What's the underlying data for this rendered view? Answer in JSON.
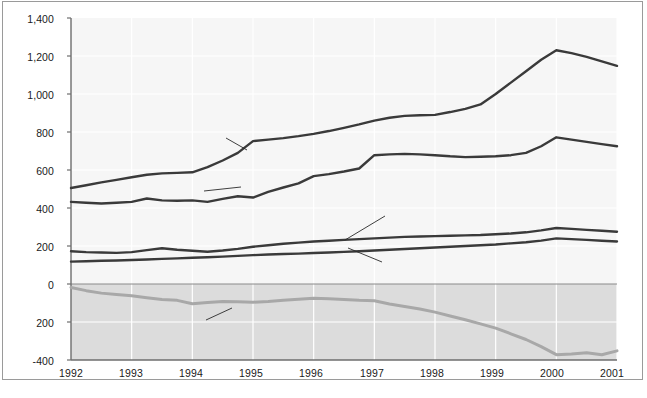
{
  "figure": {
    "background_color": "#ffffff",
    "frame_color": "#9a9a9a",
    "plot_background_color": "#f6f6f6",
    "negative_band_color": "#dcdcdc",
    "gridline_color": "#ffffff",
    "axis_color": "#6e6e6e",
    "dark_series_color": "#3a3a3a",
    "light_series_color": "#a8a8a8"
  },
  "axes": {
    "ylabel": "Annual rates in billions of dollars",
    "xlabel": "",
    "ytick_labels": [
      "1,400",
      "1,200",
      "1,000",
      "800",
      "600",
      "400",
      "200",
      "0",
      "200",
      "-400"
    ],
    "ytick_values": [
      1400,
      1200,
      1000,
      800,
      600,
      400,
      200,
      0,
      -200,
      -400
    ],
    "xtick_labels": [
      "1992",
      "1993",
      "1994",
      "1995",
      "1996",
      "1997",
      "1998",
      "1999",
      "2000",
      "2001"
    ],
    "ylim": [
      -400,
      1400
    ],
    "xlim": [
      1992,
      2001
    ],
    "grid": true,
    "legend_position": "inline-callout"
  },
  "labels": {
    "goods_imports": "Goods imports",
    "goods_exports": "Goods exports",
    "services_exports": "Services exports",
    "services_imports": "Services imports",
    "combined_balance": "Combined balance"
  },
  "chart_data": {
    "type": "line",
    "title": "",
    "xlabel": "",
    "ylabel": "Annual rates in billions of dollars",
    "xlim": [
      1992,
      2001
    ],
    "ylim": [
      -400,
      1400
    ],
    "grid": true,
    "legend_position": "inline-callout",
    "x": [
      1992,
      1992.25,
      1992.5,
      1992.75,
      1993,
      1993.25,
      1993.5,
      1993.75,
      1994,
      1994.25,
      1994.5,
      1994.75,
      1995,
      1995.25,
      1995.5,
      1995.75,
      1996,
      1996.25,
      1996.5,
      1996.75,
      1997,
      1997.25,
      1997.5,
      1997.75,
      1998,
      1998.25,
      1998.5,
      1998.75,
      1999,
      1999.25,
      1999.5,
      1999.75,
      2000,
      2000.25,
      2000.5,
      2000.75,
      2001
    ],
    "series": [
      {
        "name": "Goods imports",
        "color": "#3a3a3a",
        "values": [
          505,
          520,
          535,
          548,
          562,
          575,
          582,
          585,
          588,
          615,
          650,
          690,
          752,
          760,
          768,
          778,
          790,
          805,
          822,
          840,
          860,
          875,
          885,
          888,
          890,
          905,
          922,
          945,
          1000,
          1060,
          1120,
          1180,
          1230,
          1215,
          1195,
          1172,
          1148
        ]
      },
      {
        "name": "Goods exports",
        "color": "#3a3a3a",
        "values": [
          432,
          428,
          424,
          428,
          432,
          450,
          440,
          438,
          440,
          432,
          448,
          462,
          455,
          485,
          508,
          530,
          568,
          578,
          592,
          608,
          678,
          682,
          685,
          682,
          678,
          672,
          668,
          670,
          672,
          678,
          690,
          725,
          772,
          760,
          748,
          736,
          725
        ]
      },
      {
        "name": "Services exports",
        "color": "#3a3a3a",
        "values": [
          172,
          168,
          166,
          164,
          168,
          178,
          188,
          180,
          175,
          170,
          176,
          185,
          196,
          204,
          212,
          218,
          224,
          228,
          232,
          236,
          240,
          244,
          248,
          250,
          252,
          254,
          256,
          258,
          262,
          266,
          272,
          282,
          295,
          290,
          285,
          280,
          275
        ]
      },
      {
        "name": "Services imports",
        "color": "#3a3a3a",
        "values": [
          118,
          120,
          122,
          124,
          126,
          129,
          132,
          135,
          138,
          141,
          144,
          148,
          152,
          155,
          158,
          160,
          163,
          166,
          169,
          172,
          176,
          180,
          184,
          188,
          192,
          196,
          200,
          204,
          208,
          214,
          220,
          228,
          240,
          236,
          232,
          228,
          224
        ]
      },
      {
        "name": "Combined balance",
        "color": "#a8a8a8",
        "values": [
          -18,
          -35,
          -48,
          -55,
          -62,
          -72,
          -82,
          -86,
          -104,
          -98,
          -92,
          -94,
          -96,
          -92,
          -86,
          -80,
          -75,
          -78,
          -82,
          -86,
          -88,
          -105,
          -118,
          -132,
          -148,
          -168,
          -188,
          -210,
          -232,
          -262,
          -292,
          -330,
          -372,
          -368,
          -362,
          -372,
          -352
        ]
      }
    ]
  }
}
